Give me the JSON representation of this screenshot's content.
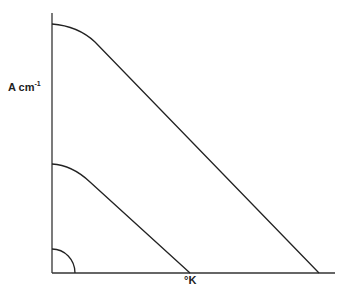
{
  "diagram": {
    "y_axis_label": "A cm",
    "y_axis_label_exponent": "-1",
    "x_axis_label": "°K",
    "curves": [
      {
        "name": "large",
        "description": "flat-topped curve from y-axis bending into straight line to x-axis (far right)"
      },
      {
        "name": "medium",
        "description": "smaller curve from y-axis bending into straight line to x-axis at °K mark"
      },
      {
        "name": "small",
        "description": "quarter-circle arc near origin"
      }
    ],
    "colors": {
      "line": "#222222",
      "background": "#ffffff"
    }
  }
}
